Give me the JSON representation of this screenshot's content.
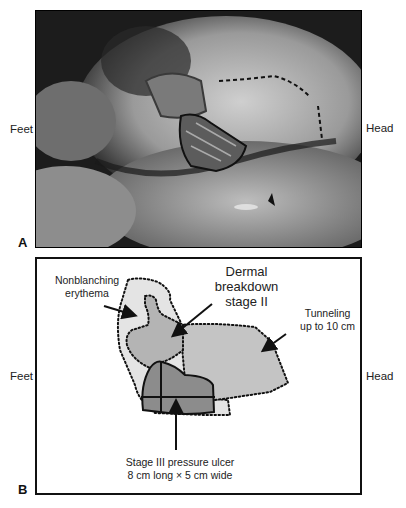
{
  "figure": {
    "panels": [
      {
        "letter": "A",
        "type": "clinical-photograph",
        "left_label": "Feet",
        "right_label": "Head"
      },
      {
        "letter": "B",
        "type": "schematic-diagram",
        "left_label": "Feet",
        "right_label": "Head",
        "annotations": {
          "erythema": "Nonblanching\nerythema",
          "erythema_l1": "Nonblanching",
          "erythema_l2": "erythema",
          "dermal_l1": "Dermal",
          "dermal_l2": "breakdown",
          "dermal_l3": "stage II",
          "tunneling_l1": "Tunneling",
          "tunneling_l2": "up to 10 cm",
          "ulcer_l1": "Stage III pressure ulcer",
          "ulcer_l2": "8 cm long × 5 cm wide"
        }
      }
    ],
    "colors": {
      "erythema_fill": "#e4e4e4",
      "dermal_fill": "#b4b4b4",
      "tunneling_fill": "#c4c4c4",
      "ulcer_fill": "#8c8c8c",
      "outline": "#111111"
    }
  }
}
